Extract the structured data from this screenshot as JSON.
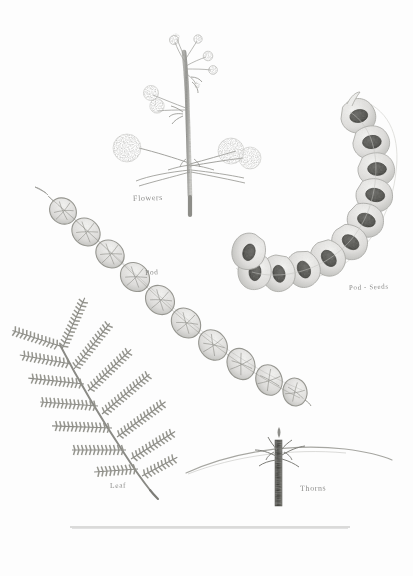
{
  "plate": {
    "title": "Botanical illustration plate",
    "medium": "graphite pencil drawing",
    "background_color": "#fdfdfd",
    "ink_color": "#8d8d8a",
    "width": 413,
    "height": 576
  },
  "labels": {
    "flowers": "Flowers",
    "pod": "Pod",
    "pod_seeds": "Pod - Seeds",
    "leaf": "Leaf",
    "thorns": "Thorns"
  },
  "specimens": [
    {
      "name": "flowers",
      "label": "Flowers",
      "description": "Upright flowering branch with globular stippled flower heads on slender peduncles and small immature buds at the apex",
      "flower_head_count": 7,
      "bud_count": 6
    },
    {
      "name": "pod-seeds",
      "label": "Pod - Seeds",
      "description": "C-shaped curved seed pod shown in section with dark seeds visible in each segment",
      "segment_count": 12,
      "seed_color": "#4f4f4c"
    },
    {
      "name": "pod",
      "label": "Pod",
      "description": "Intact constricted pod running diagonally with a pointed beak at the upper end",
      "segment_count": 10
    },
    {
      "name": "leaf",
      "label": "Leaf",
      "description": "Bipinnate compound leaf with finely divided leaflets along each pinna",
      "pinna_pairs": 7
    },
    {
      "name": "thorns",
      "label": "Thorns",
      "description": "Dark vertical stem segment crossed by a long arcing paired thorn",
      "thorn_count": 2
    }
  ],
  "rule": {
    "name": "bottom-rule",
    "x_start": 70,
    "x_end": 350,
    "y": 527,
    "color": "#b9b9b7"
  }
}
